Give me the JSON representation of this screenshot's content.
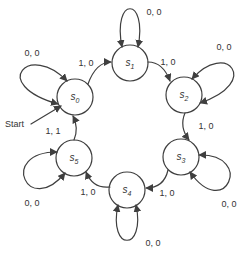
{
  "start_label": "Start",
  "states": [
    {
      "name": "s",
      "sub": "0",
      "self_loop_label": "0, 0"
    },
    {
      "name": "s",
      "sub": "1",
      "self_loop_label": "0, 0"
    },
    {
      "name": "s",
      "sub": "2",
      "self_loop_label": "0, 0"
    },
    {
      "name": "s",
      "sub": "3",
      "self_loop_label": "0, 0"
    },
    {
      "name": "s",
      "sub": "4",
      "self_loop_label": "0, 0"
    },
    {
      "name": "s",
      "sub": "5",
      "self_loop_label": "0, 0"
    }
  ],
  "transitions": [
    {
      "from": "s0",
      "to": "s1",
      "label": "1, 0"
    },
    {
      "from": "s1",
      "to": "s2",
      "label": "1, 0"
    },
    {
      "from": "s2",
      "to": "s3",
      "label": "1, 0"
    },
    {
      "from": "s3",
      "to": "s4",
      "label": "1, 0"
    },
    {
      "from": "s4",
      "to": "s5",
      "label": "1, 0"
    },
    {
      "from": "s5",
      "to": "s0",
      "label": "1, 1"
    }
  ],
  "colors": {
    "stroke": "#3f3f3f",
    "text": "#333333",
    "background": "#ffffff"
  }
}
